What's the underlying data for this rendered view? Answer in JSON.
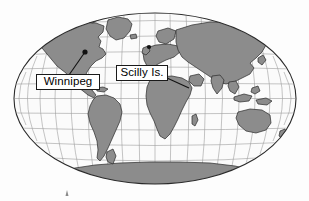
{
  "figure": {
    "type": "world-map",
    "projection": "Robinson",
    "background_color": "#fdfdfd",
    "ocean_color": "#fbfbfb",
    "land_color": "#8c8c8c",
    "land_outline_color": "#2a2a2a",
    "graticule_color": "#9a9a9a",
    "map_outline_color": "#2a2a2a",
    "width": 309,
    "height": 201
  },
  "callouts": [
    {
      "id": "winnipeg",
      "label": "Winnipeg",
      "marker": {
        "x": 85,
        "y": 52,
        "color": "#111111",
        "radius": 2.6
      },
      "box": {
        "x": 36,
        "y": 74,
        "width": 64,
        "height": 16
      },
      "leader_line": {
        "x1": 69,
        "y1": 74,
        "x2": 85,
        "y2": 52
      }
    },
    {
      "id": "scilly-is",
      "label": "Scilly Is.",
      "marker": {
        "x": 149,
        "y": 47,
        "color": "#111111",
        "radius": 2.2
      },
      "box": {
        "x": 116,
        "y": 65,
        "width": 52,
        "height": 16
      },
      "leader_line": {
        "x1": 168,
        "y1": 77,
        "x2": 188,
        "y2": 87
      }
    }
  ],
  "graticule": {
    "latitude_step_deg": 15,
    "longitude_step_deg": 20,
    "latitude_range": [
      -90,
      90
    ],
    "longitude_range": [
      -180,
      180
    ]
  },
  "map_bounds": {
    "left": 14,
    "right": 296,
    "top": 13,
    "bottom": 184,
    "center_x": 155,
    "center_y": 98.5
  },
  "tick_mark": {
    "x": 67,
    "y": 193,
    "label": ""
  }
}
